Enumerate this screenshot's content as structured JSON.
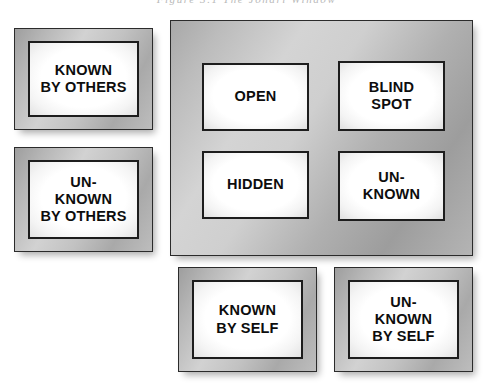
{
  "diagram": {
    "title": "Johari Window",
    "top_caption": "Figure 3.1  The Johari Window",
    "colors": {
      "frame_gray": "#bdbdbd",
      "panel_gray": "#c0c0c0",
      "border_dark": "#1d1d1d",
      "text": "#0d0d0d",
      "background": "#ffffff"
    }
  },
  "axis_labels": {
    "rows": [
      {
        "id": "known-by-others",
        "text": "KNOWN\nBY OTHERS"
      },
      {
        "id": "unknown-by-others",
        "text": "UN-\nKNOWN\nBY OTHERS"
      }
    ],
    "columns": [
      {
        "id": "known-by-self",
        "text": "KNOWN\nBY SELF"
      },
      {
        "id": "unknown-by-self",
        "text": "UN-\nKNOWN\nBY SELF"
      }
    ]
  },
  "quadrants": [
    {
      "id": "open",
      "text": "OPEN",
      "row": "known-by-others",
      "column": "known-by-self"
    },
    {
      "id": "blind-spot",
      "text": "BLIND\nSPOT",
      "row": "known-by-others",
      "column": "unknown-by-self"
    },
    {
      "id": "hidden",
      "text": "HIDDEN",
      "row": "unknown-by-others",
      "column": "known-by-self"
    },
    {
      "id": "unknown",
      "text": "UN-\nKNOWN",
      "row": "unknown-by-others",
      "column": "unknown-by-self"
    }
  ]
}
